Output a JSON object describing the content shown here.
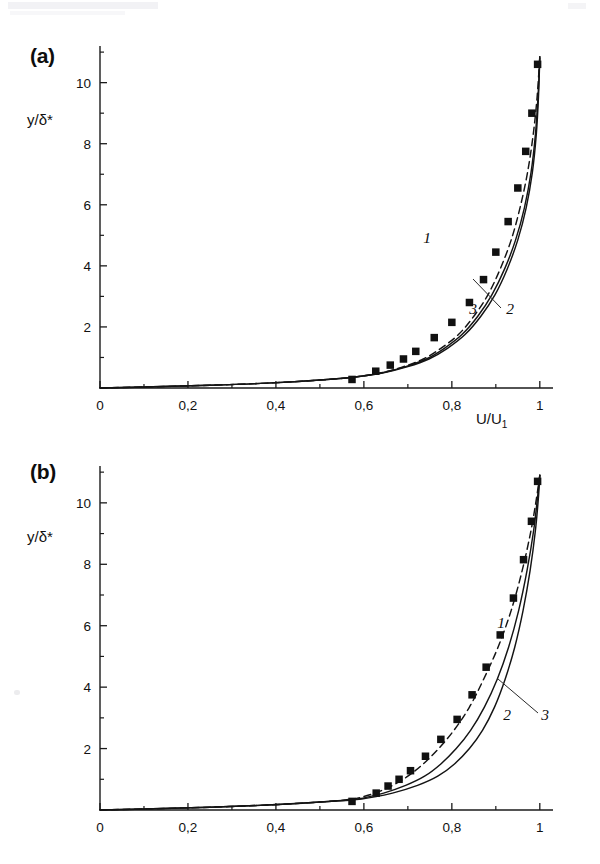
{
  "figure": {
    "panels": [
      {
        "id": "a",
        "label": "(a)",
        "xlabel": "U/U",
        "xlabel_sub": "1",
        "ylabel": "y/δ*",
        "xticks": [
          "0",
          "0,2",
          "0,4",
          "0,6",
          "0,8",
          "1"
        ],
        "yticks": [
          "2",
          "4",
          "6",
          "8",
          "10"
        ],
        "curve_labels": [
          "1",
          "2",
          "3"
        ]
      },
      {
        "id": "b",
        "label": "(b)",
        "xlabel": "Θ",
        "xlabel_sub": "",
        "ylabel": "y/δ*",
        "xticks": [
          "0",
          "0,2",
          "0,4",
          "0,6",
          "0,8",
          "1"
        ],
        "yticks": [
          "2",
          "4",
          "6",
          "8",
          "10"
        ],
        "curve_labels": [
          "1",
          "2",
          "3"
        ]
      }
    ]
  },
  "chart_data": [
    {
      "type": "line",
      "panel": "a",
      "title": "",
      "xlabel": "U/U1",
      "ylabel": "y/delta*",
      "xlim": [
        0,
        1.03
      ],
      "ylim": [
        0,
        11.2
      ],
      "xticks": [
        0,
        0.2,
        0.4,
        0.6,
        0.8,
        1
      ],
      "yticks": [
        2,
        4,
        6,
        8,
        10
      ],
      "minor_yticks": [
        1,
        3,
        5,
        7,
        9,
        11
      ],
      "grid": false,
      "legend": "inline curve numbers 1, 2, 3",
      "series": [
        {
          "name": "1",
          "style": "dashed",
          "x": [
            0.0,
            0.12,
            0.25,
            0.38,
            0.5,
            0.58,
            0.64,
            0.69,
            0.735,
            0.775,
            0.815,
            0.85,
            0.882,
            0.91,
            0.935,
            0.955,
            0.972,
            0.985,
            0.994,
            1.0
          ],
          "y": [
            0.0,
            0.04,
            0.09,
            0.16,
            0.26,
            0.36,
            0.5,
            0.7,
            0.95,
            1.3,
            1.75,
            2.35,
            3.05,
            3.9,
            4.85,
            5.9,
            7.05,
            8.3,
            9.55,
            10.85
          ]
        },
        {
          "name": "2",
          "style": "solid",
          "x": [
            0.0,
            0.12,
            0.25,
            0.38,
            0.5,
            0.58,
            0.645,
            0.7,
            0.748,
            0.79,
            0.83,
            0.866,
            0.898,
            0.926,
            0.95,
            0.969,
            0.983,
            0.992,
            0.997,
            1.0
          ],
          "y": [
            0.0,
            0.04,
            0.09,
            0.16,
            0.26,
            0.36,
            0.5,
            0.7,
            0.95,
            1.3,
            1.75,
            2.35,
            3.05,
            3.9,
            4.85,
            5.9,
            7.05,
            8.3,
            9.55,
            10.85
          ]
        },
        {
          "name": "3",
          "style": "solid",
          "x": [
            0.0,
            0.12,
            0.25,
            0.38,
            0.5,
            0.58,
            0.642,
            0.695,
            0.742,
            0.783,
            0.823,
            0.859,
            0.891,
            0.92,
            0.945,
            0.965,
            0.98,
            0.99,
            0.996,
            1.0
          ],
          "y": [
            0.0,
            0.04,
            0.09,
            0.16,
            0.26,
            0.36,
            0.5,
            0.7,
            0.95,
            1.3,
            1.75,
            2.35,
            3.05,
            3.9,
            4.85,
            5.9,
            7.05,
            8.3,
            9.55,
            10.85
          ]
        }
      ],
      "markers": {
        "name": "experiment",
        "style": "filled-square",
        "x": [
          0.573,
          0.627,
          0.66,
          0.69,
          0.718,
          0.76,
          0.8,
          0.84,
          0.872,
          0.9,
          0.928,
          0.95,
          0.968,
          0.982,
          0.995
        ],
        "y": [
          0.28,
          0.55,
          0.75,
          0.95,
          1.2,
          1.65,
          2.15,
          2.8,
          3.55,
          4.45,
          5.45,
          6.55,
          7.75,
          9.0,
          10.6
        ]
      }
    },
    {
      "type": "line",
      "panel": "b",
      "title": "",
      "xlabel": "Theta",
      "ylabel": "y/delta*",
      "xlim": [
        0,
        1.03
      ],
      "ylim": [
        0,
        11.2
      ],
      "xticks": [
        0,
        0.2,
        0.4,
        0.6,
        0.8,
        1
      ],
      "yticks": [
        2,
        4,
        6,
        8,
        10
      ],
      "minor_yticks": [
        1,
        3,
        5,
        7,
        9,
        11
      ],
      "grid": false,
      "legend": "inline curve numbers 1, 2, 3",
      "series": [
        {
          "name": "1",
          "style": "dashed",
          "x": [
            0.0,
            0.12,
            0.25,
            0.38,
            0.5,
            0.575,
            0.625,
            0.665,
            0.7,
            0.735,
            0.77,
            0.805,
            0.84,
            0.872,
            0.905,
            0.935,
            0.96,
            0.98,
            0.993,
            1.0
          ],
          "y": [
            0.0,
            0.04,
            0.09,
            0.16,
            0.26,
            0.36,
            0.55,
            0.8,
            1.1,
            1.5,
            2.0,
            2.6,
            3.35,
            4.25,
            5.3,
            6.5,
            7.8,
            9.1,
            10.2,
            10.9
          ]
        },
        {
          "name": "2",
          "style": "solid",
          "x": [
            0.0,
            0.12,
            0.25,
            0.38,
            0.5,
            0.585,
            0.645,
            0.695,
            0.738,
            0.775,
            0.81,
            0.843,
            0.874,
            0.903,
            0.929,
            0.952,
            0.971,
            0.986,
            0.995,
            1.0
          ],
          "y": [
            0.0,
            0.04,
            0.09,
            0.16,
            0.26,
            0.36,
            0.55,
            0.8,
            1.1,
            1.5,
            2.0,
            2.6,
            3.35,
            4.25,
            5.3,
            6.5,
            7.8,
            9.1,
            10.2,
            10.9
          ]
        },
        {
          "name": "3",
          "style": "solid",
          "x": [
            0.0,
            0.12,
            0.25,
            0.38,
            0.5,
            0.595,
            0.665,
            0.722,
            0.768,
            0.806,
            0.84,
            0.87,
            0.897,
            0.921,
            0.943,
            0.962,
            0.978,
            0.99,
            0.997,
            1.0
          ],
          "y": [
            0.0,
            0.04,
            0.09,
            0.16,
            0.26,
            0.36,
            0.55,
            0.8,
            1.1,
            1.5,
            2.0,
            2.6,
            3.35,
            4.25,
            5.3,
            6.5,
            7.8,
            9.1,
            10.2,
            10.9
          ]
        }
      ],
      "markers": {
        "name": "experiment",
        "style": "filled-square",
        "x": [
          0.573,
          0.628,
          0.655,
          0.68,
          0.706,
          0.74,
          0.775,
          0.812,
          0.846,
          0.878,
          0.91,
          0.94,
          0.963,
          0.981,
          0.995
        ],
        "y": [
          0.28,
          0.55,
          0.78,
          1.0,
          1.28,
          1.75,
          2.3,
          2.95,
          3.75,
          4.65,
          5.7,
          6.9,
          8.15,
          9.4,
          10.7
        ]
      }
    }
  ]
}
